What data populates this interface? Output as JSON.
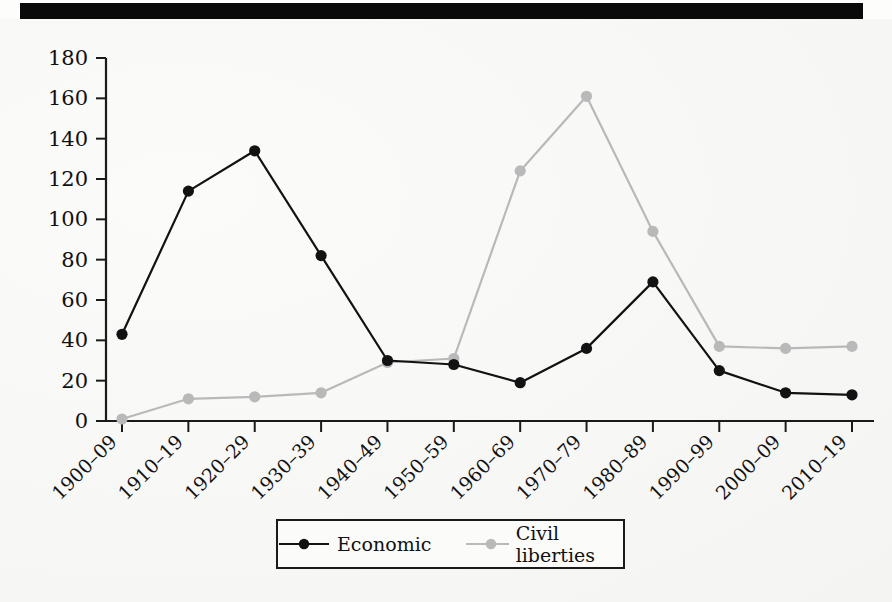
{
  "page": {
    "scan_artifact": "black-scan-bar",
    "bleed_text_right": [
      "",
      "",
      "",
      "",
      "",
      "",
      "",
      ""
    ],
    "bleed_text_left": [
      "",
      "",
      "",
      ""
    ]
  },
  "axes": {
    "y_ticks": [
      "0",
      "20",
      "40",
      "60",
      "80",
      "100",
      "120",
      "140",
      "160",
      "180"
    ],
    "x_ticks": [
      "1900–09",
      "1910–19",
      "1920–29",
      "1930–39",
      "1940–49",
      "1950–59",
      "1960–69",
      "1970–79",
      "1980–89",
      "1990–99",
      "2000–09",
      "2010–19"
    ]
  },
  "legend": {
    "items": [
      {
        "label": "Economic",
        "color": "#121212",
        "marker": "filled-circle"
      },
      {
        "label": "Civil liberties",
        "color": "#b9b9b9",
        "marker": "filled-circle"
      }
    ]
  },
  "colors": {
    "economic": "#121212",
    "civil_liberties": "#b9b9b9",
    "axis": "#1a1a1a",
    "paper": "#f6f6f4",
    "scanbar": "#0a0a0a"
  },
  "chart_data": {
    "type": "line",
    "title": "",
    "xlabel": "",
    "ylabel": "",
    "ylim": [
      0,
      180
    ],
    "ytick_step": 20,
    "grid": false,
    "legend_position": "bottom-center",
    "categories": [
      "1900–09",
      "1910–19",
      "1920–29",
      "1930–39",
      "1940–49",
      "1950–59",
      "1960–69",
      "1970–79",
      "1980–89",
      "1990–99",
      "2000–09",
      "2010–19"
    ],
    "series": [
      {
        "name": "Economic",
        "color": "#121212",
        "marker": "filled-circle",
        "values": [
          43,
          114,
          134,
          82,
          30,
          28,
          19,
          36,
          69,
          25,
          14,
          13
        ]
      },
      {
        "name": "Civil liberties",
        "color": "#b9b9b9",
        "marker": "filled-circle",
        "values": [
          1,
          11,
          12,
          14,
          29,
          31,
          124,
          161,
          94,
          37,
          36,
          37
        ]
      }
    ]
  }
}
